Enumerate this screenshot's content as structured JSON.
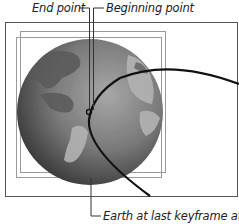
{
  "callouts": {
    "end_point": "End point",
    "beginning_point": "Beginning point",
    "earth_last_keyframe": "Earth at last keyframe attached"
  },
  "colors": {
    "frame": "#555555",
    "bbox": "#9a9a9a",
    "path": "#111111",
    "globe_dark": "#3a3a3a",
    "globe_light": "#9a9a9a",
    "land": "#b5b5b5"
  }
}
